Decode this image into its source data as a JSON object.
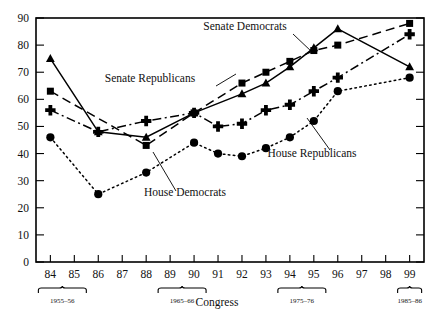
{
  "chart_data": {
    "type": "line",
    "title": "",
    "xlabel": "Congress",
    "ylabel": "",
    "xlim": [
      83.4,
      99.6
    ],
    "ylim": [
      0,
      90
    ],
    "grid": false,
    "legend_position": "inline-annotations",
    "categories": [
      "84",
      "85",
      "86",
      "87",
      "88",
      "89",
      "90",
      "91",
      "92",
      "93",
      "94",
      "95",
      "96",
      "97",
      "98",
      "99"
    ],
    "x_tick_labels": [
      "84",
      "85",
      "86",
      "87",
      "88",
      "89",
      "90",
      "91",
      "92",
      "93",
      "94",
      "95",
      "96",
      "97",
      "98",
      "99"
    ],
    "y_tick_labels": [
      "0",
      "10",
      "20",
      "30",
      "40",
      "50",
      "60",
      "70",
      "80",
      "90"
    ],
    "y_ticks": [
      0,
      10,
      20,
      30,
      40,
      50,
      60,
      70,
      80,
      90
    ],
    "era_brackets": [
      {
        "label": "1955–56",
        "start": "84",
        "end": "85"
      },
      {
        "label": "1965–66",
        "start": "89",
        "end": "90"
      },
      {
        "label": "1975–76",
        "start": "94",
        "end": "95"
      },
      {
        "label": "1985–86",
        "start": "99",
        "end": "99"
      }
    ],
    "series": [
      {
        "name": "Senate Democrats",
        "marker": "triangle",
        "dash": "solid",
        "x": [
          84,
          86,
          88,
          90,
          92,
          93,
          94,
          95,
          96,
          99
        ],
        "values": [
          75,
          48,
          46,
          55,
          62,
          66,
          72,
          79,
          86,
          72
        ]
      },
      {
        "name": "Senate Republicans",
        "marker": "square",
        "dash": "dashed",
        "x": [
          84,
          88,
          90,
          92,
          93,
          94,
          95,
          96,
          99
        ],
        "values": [
          63,
          43,
          55,
          66,
          70,
          74,
          78,
          80,
          88
        ]
      },
      {
        "name": "House Republicans",
        "marker": "plus",
        "dash": "dashdot",
        "x": [
          84,
          86,
          88,
          90,
          91,
          92,
          93,
          94,
          95,
          96,
          99
        ],
        "values": [
          56,
          48,
          52,
          55,
          50,
          51,
          56,
          58,
          63,
          68,
          84
        ]
      },
      {
        "name": "House Democrats",
        "marker": "circle",
        "dash": "dotted",
        "x": [
          84,
          86,
          88,
          90,
          91,
          92,
          93,
          94,
          95,
          96,
          99
        ],
        "values": [
          46,
          25,
          33,
          44,
          40,
          39,
          42,
          46,
          52,
          63,
          68
        ]
      }
    ],
    "annotations": [
      {
        "name": "senate-democrats",
        "text": "Senate Democrats",
        "text_x": 245,
        "text_y": 30,
        "leader": [
          [
            293,
            34
          ],
          [
            312,
            52
          ]
        ]
      },
      {
        "name": "senate-republicans",
        "text": "Senate Republicans",
        "text_x": 150,
        "text_y": 82,
        "leader": [
          [
            216,
            86
          ],
          [
            236,
            74
          ]
        ]
      },
      {
        "name": "house-republicans",
        "text": "House Republicans",
        "text_x": 312,
        "text_y": 157,
        "leader": [
          [
            330,
            150
          ],
          [
            307,
            118
          ]
        ]
      },
      {
        "name": "house-democrats",
        "text": "House Democrats",
        "text_x": 185,
        "text_y": 196,
        "leader": [
          [
            176,
            191
          ],
          [
            153,
            152
          ]
        ]
      }
    ],
    "colors": {
      "ink": "#000000",
      "background": "#ffffff"
    }
  }
}
